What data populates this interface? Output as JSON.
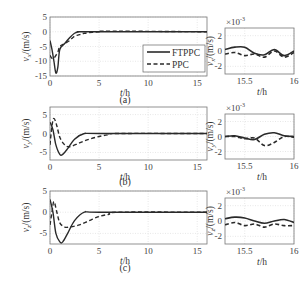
{
  "figure": {
    "legend": {
      "series_a": "FTPPC",
      "series_b": "PPC"
    },
    "panels": [
      {
        "caption": "(a)",
        "ylabel_var": "v",
        "ylabel_sub": "x",
        "ylabel_unit": "/(m/s)",
        "xlabel_var": "t",
        "xlabel_unit": "/h",
        "main_yticks": [
          "5",
          "0",
          "-5",
          "-10",
          "-15"
        ],
        "main_xticks": [
          "0",
          "5",
          "10",
          "15"
        ],
        "zoom_exponent": "×10",
        "zoom_exp_power": "-3",
        "zoom_yticks": [
          "2",
          "0",
          "-2"
        ],
        "zoom_xticks": [
          "15.5",
          "16"
        ]
      },
      {
        "caption": "(b)",
        "ylabel_var": "v",
        "ylabel_sub": "y",
        "ylabel_unit": "/(m/s)",
        "xlabel_var": "t",
        "xlabel_unit": "/h",
        "main_yticks": [
          "5",
          "0",
          "-5"
        ],
        "main_xticks": [
          "0",
          "5",
          "10",
          "15"
        ],
        "zoom_exponent": "×10",
        "zoom_exp_power": "-3",
        "zoom_yticks": [
          "2",
          "0",
          "-2"
        ],
        "zoom_xticks": [
          "15.5",
          "16"
        ]
      },
      {
        "caption": "(c)",
        "ylabel_var": "v",
        "ylabel_sub": "z",
        "ylabel_unit": "/(m/s)",
        "xlabel_var": "t",
        "xlabel_unit": "/h",
        "main_yticks": [
          "5",
          "0",
          "-5"
        ],
        "main_xticks": [
          "0",
          "5",
          "10",
          "15"
        ],
        "zoom_exponent": "×10",
        "zoom_exp_power": "-3",
        "zoom_yticks": [
          "2",
          "0",
          "-2"
        ],
        "zoom_xticks": [
          "15.5",
          "16"
        ]
      }
    ]
  },
  "chart_data": [
    {
      "type": "line",
      "title": "(a)",
      "xlabel": "t/h",
      "ylabel": "v_x/(m/s)",
      "xlim": [
        0,
        16
      ],
      "ylim": [
        -15,
        5
      ],
      "grid": true,
      "legend_position": "center-right",
      "series": [
        {
          "name": "FTPPC",
          "style": "solid",
          "x": [
            0,
            0.2,
            0.4,
            0.6,
            0.8,
            1,
            1.5,
            2,
            2.5,
            3,
            4,
            16
          ],
          "y": [
            -3,
            -6,
            -10,
            -14,
            -12,
            -6,
            -4,
            -2,
            -0.5,
            0,
            0,
            0
          ]
        },
        {
          "name": "PPC",
          "style": "dashed",
          "x": [
            0,
            0.2,
            0.4,
            0.6,
            0.8,
            1,
            1.5,
            2,
            2.5,
            3,
            3.5,
            5,
            6,
            16
          ],
          "y": [
            -8,
            -9,
            -9,
            -8,
            -7,
            -5,
            -4,
            -3,
            -1.5,
            -1,
            -0.5,
            0,
            0.2,
            0
          ]
        }
      ]
    },
    {
      "type": "line",
      "title": "(a) zoom",
      "xlabel": "t/h",
      "ylabel": "v_x/(m/s)",
      "y_scale": "×10^-3",
      "xlim": [
        15.3,
        16
      ],
      "ylim": [
        -3,
        3
      ],
      "grid": true,
      "series": [
        {
          "name": "FTPPC",
          "style": "solid",
          "x": [
            15.3,
            15.4,
            15.5,
            15.6,
            15.7,
            15.8,
            15.9,
            16
          ],
          "y": [
            0.2,
            0.5,
            0.5,
            -0.3,
            -0.5,
            0.2,
            -0.6,
            0
          ]
        },
        {
          "name": "PPC",
          "style": "dashed",
          "x": [
            15.3,
            15.4,
            15.5,
            15.6,
            15.7,
            15.8,
            15.9,
            16
          ],
          "y": [
            -0.4,
            -0.2,
            -0.6,
            -0.4,
            -0.8,
            0,
            -0.8,
            -0.2
          ]
        }
      ]
    },
    {
      "type": "line",
      "title": "(b)",
      "xlabel": "t/h",
      "ylabel": "v_y/(m/s)",
      "xlim": [
        0,
        16
      ],
      "ylim": [
        -7,
        7
      ],
      "grid": true,
      "series": [
        {
          "name": "FTPPC",
          "style": "solid",
          "x": [
            0,
            0.3,
            0.6,
            1,
            1.3,
            1.8,
            2.5,
            3.5,
            5,
            16
          ],
          "y": [
            3,
            1,
            -3,
            -5.5,
            -5.5,
            -4,
            -1.5,
            0,
            0,
            0
          ]
        },
        {
          "name": "PPC",
          "style": "dashed",
          "x": [
            0,
            0.2,
            0.4,
            0.7,
            1,
            1.5,
            2,
            3,
            4,
            5,
            6,
            7,
            16
          ],
          "y": [
            -3,
            2,
            4,
            2,
            -1,
            -3,
            -3.5,
            -2.5,
            -1.5,
            -0.8,
            -0.3,
            0,
            0
          ]
        }
      ]
    },
    {
      "type": "line",
      "title": "(b) zoom",
      "xlabel": "t/h",
      "ylabel": "v_y/(m/s)",
      "y_scale": "×10^-3",
      "xlim": [
        15.3,
        16
      ],
      "ylim": [
        -3,
        3
      ],
      "grid": true,
      "series": [
        {
          "name": "FTPPC",
          "style": "solid",
          "x": [
            15.3,
            15.4,
            15.5,
            15.6,
            15.7,
            15.8,
            15.9,
            16
          ],
          "y": [
            0,
            0.1,
            -0.2,
            -0.4,
            0.3,
            0.5,
            0.1,
            0
          ]
        },
        {
          "name": "PPC",
          "style": "dashed",
          "x": [
            15.3,
            15.4,
            15.5,
            15.6,
            15.7,
            15.8,
            15.9,
            16
          ],
          "y": [
            0,
            0,
            -0.3,
            -0.2,
            -1.2,
            -0.8,
            0,
            -0.1
          ]
        }
      ]
    },
    {
      "type": "line",
      "title": "(c)",
      "xlabel": "t/h",
      "ylabel": "v_z/(m/s)",
      "xlim": [
        0,
        16
      ],
      "ylim": [
        -7.5,
        5
      ],
      "grid": true,
      "series": [
        {
          "name": "FTPPC",
          "style": "solid",
          "x": [
            0,
            0.3,
            0.6,
            1,
            1.3,
            1.8,
            2.5,
            3.5,
            5,
            16
          ],
          "y": [
            3,
            0,
            -5,
            -7,
            -7,
            -5,
            -2,
            0,
            0,
            0
          ]
        },
        {
          "name": "PPC",
          "style": "dashed",
          "x": [
            0,
            0.2,
            0.4,
            0.7,
            1,
            1.5,
            2,
            3,
            4,
            5,
            6,
            7,
            16
          ],
          "y": [
            -3,
            0,
            2.5,
            0,
            -2.5,
            -3.5,
            -3.5,
            -3,
            -2,
            -1,
            -0.5,
            0,
            0
          ]
        }
      ]
    },
    {
      "type": "line",
      "title": "(c) zoom",
      "xlabel": "t/h",
      "ylabel": "v_z/(m/s)",
      "y_scale": "×10^-3",
      "xlim": [
        15.3,
        16
      ],
      "ylim": [
        -3,
        3
      ],
      "grid": true,
      "series": [
        {
          "name": "FTPPC",
          "style": "solid",
          "x": [
            15.3,
            15.4,
            15.5,
            15.6,
            15.7,
            15.8,
            15.9,
            16
          ],
          "y": [
            0.3,
            0.5,
            0.4,
            0,
            -0.3,
            0,
            0.2,
            -0.2
          ]
        },
        {
          "name": "PPC",
          "style": "dashed",
          "x": [
            15.3,
            15.4,
            15.5,
            15.6,
            15.7,
            15.8,
            15.9,
            16
          ],
          "y": [
            -0.5,
            -0.2,
            -0.6,
            -0.4,
            -0.8,
            -0.4,
            -0.6,
            -0.6
          ]
        }
      ]
    }
  ]
}
